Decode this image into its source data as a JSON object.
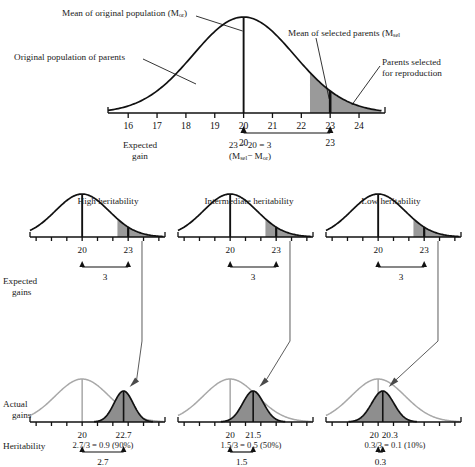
{
  "figure": {
    "type": "diagram"
  },
  "top_panel": {
    "callouts": {
      "mean_original": "Mean of original population (M",
      "mean_original_sub": "or",
      "mean_original_tail": ")",
      "original_population": "Original population of parents",
      "mean_selected": "Mean of selected parents (M",
      "mean_selected_sub": "sel",
      "parents_selected_line1": "Parents selected",
      "parents_selected_line2": "for reproduction"
    },
    "axis": {
      "ticks": [
        "16",
        "17",
        "18",
        "19",
        "20",
        "21",
        "22",
        "23",
        "24"
      ],
      "min": 15.3,
      "max": 24.9
    },
    "mean_original_value": 20,
    "mean_selected_value": 23,
    "selection_cutoff": 22.3,
    "bracket": {
      "left_label": "20",
      "right_label": "23"
    },
    "expected_gain_label_line1": "Expected",
    "expected_gain_label_line2": "gain",
    "equation_line1": "23 − 20 = 3",
    "equation_line2_open": "(M",
    "equation_line2_sub1": "sel",
    "equation_line2_mid": "− M",
    "equation_line2_sub2": "or",
    "equation_line2_close": ")"
  },
  "row_labels": {
    "expected_gains_line1": "Expected",
    "expected_gains_line2": "gains",
    "actual_gains_line1": "Actual",
    "actual_gains_line2": "gains",
    "heritability": "Heritability"
  },
  "columns": [
    {
      "title": "High heritability",
      "parent": {
        "mean": "20",
        "selected": "23",
        "gain": "3"
      },
      "offspring": {
        "parent_mean": "20",
        "offspring_mean": "22.7",
        "gain": "2.7",
        "offspring_mean_value": 22.7,
        "offspring_spread": 0.62
      },
      "heritability_formula": "2.7/3 = 0.9 (90%)"
    },
    {
      "title": "Intermediate heritability",
      "parent": {
        "mean": "20",
        "selected": "23",
        "gain": "3"
      },
      "offspring": {
        "parent_mean": "20",
        "offspring_mean": "21.5",
        "gain": "1.5",
        "offspring_mean_value": 21.5,
        "offspring_spread": 0.68
      },
      "heritability_formula": "1.5/3 = 0.5 (50%)"
    },
    {
      "title": "Low heritability",
      "parent": {
        "mean": "20",
        "selected": "23",
        "gain": "3"
      },
      "offspring": {
        "parent_mean": "20",
        "offspring_mean": "20.3",
        "gain": "0.3",
        "offspring_mean_value": 20.3,
        "offspring_spread": 0.72
      },
      "heritability_formula": "0.3/3 = 0.1 (10%)"
    }
  ],
  "chart_data": {
    "type": "line",
    "parent_distribution": {
      "mean": 20,
      "sd": 1.75,
      "selection_threshold": 22.3,
      "selected_mean": 23,
      "expected_gain": 3
    },
    "panels": [
      {
        "name": "High heritability",
        "actual_gain": 2.7,
        "offspring_mean": 22.7,
        "heritability": 0.9
      },
      {
        "name": "Intermediate heritability",
        "actual_gain": 1.5,
        "offspring_mean": 21.5,
        "heritability": 0.5
      },
      {
        "name": "Low heritability",
        "actual_gain": 0.3,
        "offspring_mean": 20.3,
        "heritability": 0.1
      }
    ]
  },
  "colors": {
    "shade": "#9a9a9a",
    "stroke": "#111111",
    "gray_curve": "#a8a8a8"
  }
}
